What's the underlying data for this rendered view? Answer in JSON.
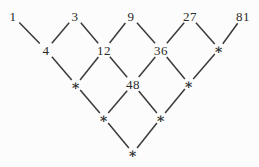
{
  "diagram": {
    "type": "lattice",
    "background": "#fcfcfc",
    "text_color": "#2a2a2a",
    "edge_color": "#3a3a3a",
    "edge_width": 1.5,
    "label_gap": {
      "number": 9,
      "asterisk": 6.5
    },
    "nodes": [
      {
        "id": "r0c0",
        "label": "1",
        "type": "number",
        "x": 13,
        "y": 16
      },
      {
        "id": "r0c1",
        "label": "3",
        "type": "number",
        "x": 75,
        "y": 16
      },
      {
        "id": "r0c2",
        "label": "9",
        "type": "number",
        "x": 131,
        "y": 16
      },
      {
        "id": "r0c3",
        "label": "27",
        "type": "number",
        "x": 190,
        "y": 16
      },
      {
        "id": "r0c4",
        "label": "81",
        "type": "number",
        "x": 243,
        "y": 16
      },
      {
        "id": "r1c0",
        "label": "4",
        "type": "number",
        "x": 46,
        "y": 50
      },
      {
        "id": "r1c1",
        "label": "12",
        "type": "number",
        "x": 104,
        "y": 50
      },
      {
        "id": "r1c2",
        "label": "36",
        "type": "number",
        "x": 161,
        "y": 50
      },
      {
        "id": "r1c3",
        "label": "∗",
        "type": "asterisk",
        "x": 219,
        "y": 49
      },
      {
        "id": "r2c0",
        "label": "∗",
        "type": "asterisk",
        "x": 76,
        "y": 85
      },
      {
        "id": "r2c1",
        "label": "48",
        "type": "number",
        "x": 133,
        "y": 84
      },
      {
        "id": "r2c2",
        "label": "∗",
        "type": "asterisk",
        "x": 189,
        "y": 84
      },
      {
        "id": "r3c0",
        "label": "∗",
        "type": "asterisk",
        "x": 104,
        "y": 118
      },
      {
        "id": "r3c1",
        "label": "∗",
        "type": "asterisk",
        "x": 161,
        "y": 118
      },
      {
        "id": "r4c0",
        "label": "∗",
        "type": "asterisk",
        "x": 133,
        "y": 153
      }
    ],
    "edges": [
      [
        "r0c0",
        "r1c0"
      ],
      [
        "r0c1",
        "r1c0"
      ],
      [
        "r0c1",
        "r1c1"
      ],
      [
        "r0c2",
        "r1c1"
      ],
      [
        "r0c2",
        "r1c2"
      ],
      [
        "r0c3",
        "r1c2"
      ],
      [
        "r0c3",
        "r1c3"
      ],
      [
        "r0c4",
        "r1c3"
      ],
      [
        "r1c0",
        "r2c0"
      ],
      [
        "r1c1",
        "r2c0"
      ],
      [
        "r1c1",
        "r2c1"
      ],
      [
        "r1c2",
        "r2c1"
      ],
      [
        "r1c2",
        "r2c2"
      ],
      [
        "r1c3",
        "r2c2"
      ],
      [
        "r2c0",
        "r3c0"
      ],
      [
        "r2c1",
        "r3c0"
      ],
      [
        "r2c1",
        "r3c1"
      ],
      [
        "r2c2",
        "r3c1"
      ],
      [
        "r3c0",
        "r4c0"
      ],
      [
        "r3c1",
        "r4c0"
      ]
    ]
  }
}
